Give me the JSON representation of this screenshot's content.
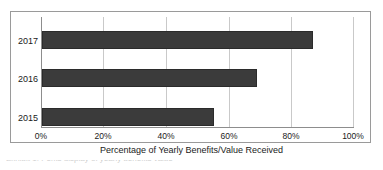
{
  "figure": {
    "background": "#ffffff",
    "frame_color": "#9a9a9a",
    "bar_color": "#3b3b3b",
    "grid_color": "#c9c9c9",
    "caption_partial": "Exhibit 1.  Perks display of yearly benefits value"
  },
  "chart_data": {
    "type": "bar",
    "orientation": "horizontal",
    "title": "",
    "xlabel": "Percentage of Yearly Benefits/Value Received",
    "ylabel": "",
    "categories": [
      "2015",
      "2016",
      "2017"
    ],
    "values": [
      55,
      69,
      87
    ],
    "display_categories": [
      "2017",
      "2016",
      "2015"
    ],
    "display_values": [
      87,
      69,
      55
    ],
    "xlim": [
      0,
      100
    ],
    "xticks": [
      0,
      20,
      40,
      60,
      80,
      100
    ],
    "xtick_labels": [
      "0%",
      "20%",
      "40%",
      "60%",
      "80%",
      "100%"
    ],
    "grid": "vertical",
    "legend": "none",
    "series": [
      {
        "name": "Percentage of Yearly Benefits/Value Received",
        "values": [
          87,
          69,
          55
        ]
      }
    ]
  }
}
